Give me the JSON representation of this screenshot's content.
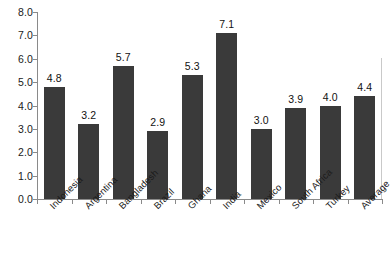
{
  "chart_data": {
    "type": "bar",
    "title": "",
    "subtitle": "",
    "xlabel": "",
    "ylabel": "",
    "ylim": [
      0.0,
      8.0
    ],
    "ytick_step": 1.0,
    "ytick_labels": [
      "8.0",
      "7.0",
      "6.0",
      "5.0",
      "4.0",
      "3.0",
      "2.0",
      "1.0",
      "0.0"
    ],
    "ytick_values": [
      8.0,
      7.0,
      6.0,
      5.0,
      4.0,
      3.0,
      2.0,
      1.0,
      0.0
    ],
    "grid": false,
    "legend": false,
    "legend_position": "none",
    "categories": [
      "Indonesia",
      "Argentina",
      "Bangladesh",
      "Brazil",
      "Ghana",
      "India",
      "Mexico",
      "South Africa",
      "Turkey",
      "Average"
    ],
    "values": [
      4.8,
      3.2,
      5.7,
      2.9,
      5.3,
      7.1,
      3.0,
      3.9,
      4.0,
      4.4
    ],
    "data_labels": [
      "4.8",
      "3.2",
      "5.7",
      "2.9",
      "5.3",
      "7.1",
      "3.0",
      "3.9",
      "4.0",
      "4.4"
    ],
    "bar_color": "#3a3a3a",
    "axis_color": "#8a8a8a",
    "background_color": "#ffffff",
    "xtick_label_rotation": -45
  },
  "caption": {
    "text": "",
    "visible_fragment": ""
  }
}
